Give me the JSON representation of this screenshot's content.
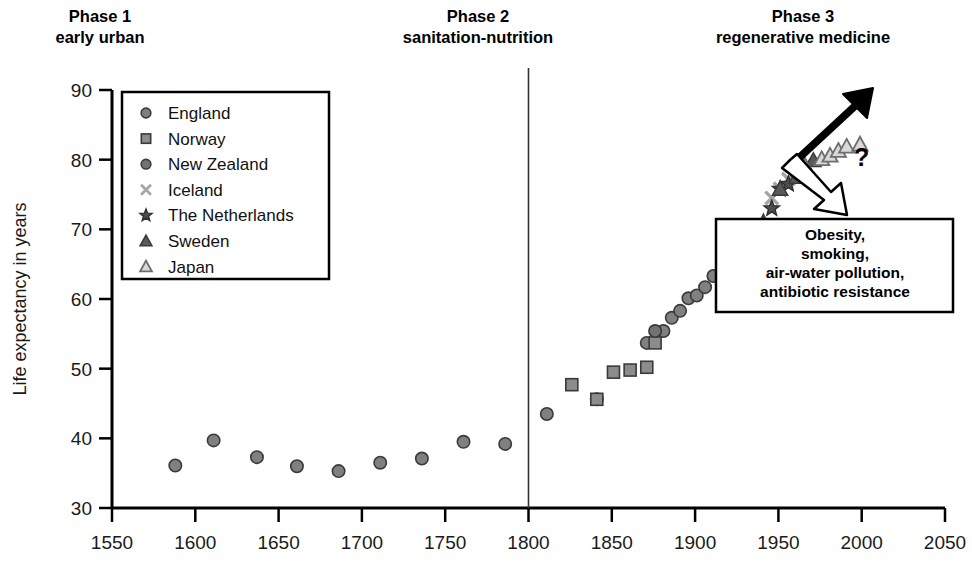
{
  "chart_data": {
    "type": "scatter",
    "title": "",
    "xlabel": "",
    "ylabel": "Life expectancy in years",
    "xlim": [
      1550,
      2050
    ],
    "ylim": [
      30,
      90
    ],
    "xticks": [
      1550,
      1600,
      1650,
      1700,
      1750,
      1800,
      1850,
      1900,
      1950,
      2000,
      2050
    ],
    "yticks": [
      30,
      40,
      50,
      60,
      70,
      80,
      90
    ],
    "grid": false,
    "legend_position": "top-left",
    "series": [
      {
        "name": "England",
        "marker": "circle-filled",
        "color": "#808080",
        "points": [
          [
            1588,
            36.1
          ],
          [
            1611,
            39.7
          ],
          [
            1637,
            37.3
          ],
          [
            1661,
            36.0
          ],
          [
            1686,
            35.3
          ],
          [
            1711,
            36.5
          ],
          [
            1736,
            37.1
          ],
          [
            1761,
            39.5
          ],
          [
            1786,
            39.2
          ],
          [
            1811,
            43.5
          ],
          [
            1841,
            45.6
          ],
          [
            1871,
            53.7
          ],
          [
            1881,
            55.4
          ],
          [
            1886,
            57.3
          ],
          [
            1891,
            58.3
          ],
          [
            1896,
            60.1
          ],
          [
            1901,
            60.5
          ],
          [
            1906,
            61.7
          ],
          [
            1911,
            63.3
          ],
          [
            1916,
            63.8
          ],
          [
            1921,
            65.2
          ],
          [
            1926,
            65.9
          ],
          [
            1931,
            67.1
          ],
          [
            1936,
            70.2
          ],
          [
            1941,
            70.4
          ]
        ]
      },
      {
        "name": "Norway",
        "marker": "square-filled",
        "color": "#8c8c8c",
        "points": [
          [
            1826,
            47.7
          ],
          [
            1841,
            45.6
          ],
          [
            1851,
            49.5
          ],
          [
            1861,
            49.8
          ],
          [
            1871,
            50.2
          ],
          [
            1876,
            53.7
          ]
        ]
      },
      {
        "name": "New Zealand",
        "marker": "circle-filled",
        "color": "#737373",
        "points": [
          [
            1876,
            55.4
          ]
        ]
      },
      {
        "name": "Iceland",
        "marker": "x",
        "color": "#a6a6a6",
        "points": [
          [
            1946,
            74.5
          ],
          [
            1951,
            75.8
          ],
          [
            1956,
            77.2
          ],
          [
            1961,
            78.2
          ],
          [
            1966,
            79.1
          ]
        ]
      },
      {
        "name": "The Netherlands",
        "marker": "star",
        "color": "#4d4d4d",
        "points": [
          [
            1941,
            71.0
          ],
          [
            1946,
            73.0
          ],
          [
            1951,
            75.8
          ],
          [
            1956,
            76.5
          ],
          [
            1961,
            78.2
          ]
        ]
      },
      {
        "name": "Sweden",
        "marker": "triangle-filled",
        "color": "#595959",
        "points": [
          [
            1941,
            71.0
          ],
          [
            1951,
            75.8
          ],
          [
            1961,
            77.5
          ],
          [
            1966,
            79.1
          ],
          [
            1971,
            79.9
          ]
        ]
      },
      {
        "name": "Japan",
        "marker": "triangle-open",
        "color": "#bfbfbf",
        "points": [
          [
            1966,
            79.1
          ],
          [
            1976,
            80.1
          ],
          [
            1981,
            80.6
          ],
          [
            1986,
            81.3
          ],
          [
            1991,
            81.9
          ],
          [
            1999,
            82.2
          ]
        ]
      }
    ],
    "divider_years": [
      1800
    ],
    "annotations": [
      {
        "name": "optimistic-arrow",
        "style": "filled-black",
        "direction": "up-right"
      },
      {
        "name": "pessimistic-arrow",
        "style": "outline-white",
        "direction": "down-right"
      },
      {
        "name": "question-mark",
        "text": "?"
      }
    ]
  },
  "phases": [
    {
      "title": "Phase 1",
      "subtitle": "early urban"
    },
    {
      "title": "Phase 2",
      "subtitle": "sanitation-nutrition"
    },
    {
      "title": "Phase 3",
      "subtitle": "regenerative medicine"
    }
  ],
  "legend": {
    "items": [
      {
        "label": "England",
        "marker": "circle-filled"
      },
      {
        "label": "Norway",
        "marker": "square-filled"
      },
      {
        "label": "New Zealand",
        "marker": "circle-filled"
      },
      {
        "label": "Iceland",
        "marker": "x"
      },
      {
        "label": "The Netherlands",
        "marker": "star"
      },
      {
        "label": "Sweden",
        "marker": "triangle-filled"
      },
      {
        "label": "Japan",
        "marker": "triangle-open"
      }
    ]
  },
  "callout": {
    "lines": [
      "Obesity,",
      "smoking,",
      "air-water pollution,",
      "antibiotic resistance"
    ]
  },
  "axis": {
    "y_title": "Life expectancy in years",
    "y_ticks": [
      "90",
      "80",
      "70",
      "60",
      "50",
      "40",
      "30"
    ],
    "x_ticks": [
      "1550",
      "1600",
      "1650",
      "1700",
      "1750",
      "1800",
      "1850",
      "1900",
      "1950",
      "2000",
      "2050"
    ]
  },
  "symbols": {
    "question": "?"
  }
}
